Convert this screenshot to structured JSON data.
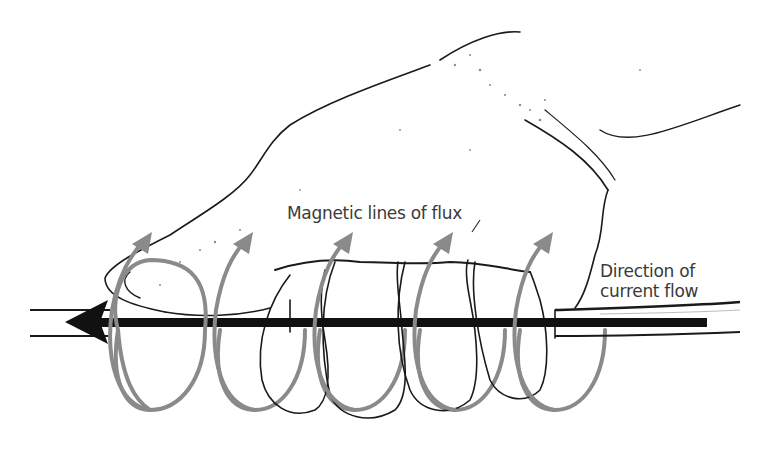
{
  "diagram": {
    "labels": {
      "flux": "Magnetic lines of flux",
      "current_line1": "Direction of",
      "current_line2": "current flow"
    },
    "elements": {
      "conductor": "wire",
      "current_arrow_direction": "left",
      "flux_loop_count": 5,
      "hand": "right hand gripping wire, thumb pointing left"
    },
    "colors": {
      "background": "#ffffff",
      "ink": "#1a1a1a",
      "flux_loops": "#8a8a8a",
      "label_text": "#3a3a3a"
    }
  }
}
